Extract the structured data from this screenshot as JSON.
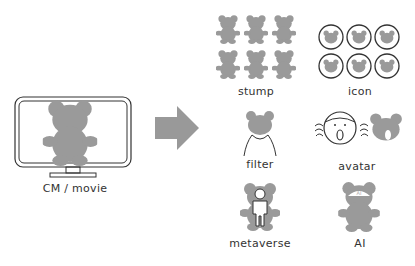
{
  "source": {
    "label": "CM / movie",
    "icon": "monitor-with-bear-icon"
  },
  "arrow": {
    "icon": "right-arrow-icon",
    "color": "#999999"
  },
  "outputs": [
    {
      "id": "stump",
      "label": "stump",
      "icon": "bear-stamps-grid-icon"
    },
    {
      "id": "icon",
      "label": "icon",
      "icon": "bear-circle-icons-grid-icon"
    },
    {
      "id": "filter",
      "label": "filter",
      "icon": "bear-face-filter-icon"
    },
    {
      "id": "avatar",
      "label": "avatar",
      "icon": "face-to-bear-avatar-icon"
    },
    {
      "id": "metaverse",
      "label": "metaverse",
      "icon": "human-in-bear-suit-icon"
    },
    {
      "id": "ai",
      "label": "AI",
      "icon": "ai-bear-icon",
      "badge": "AI"
    }
  ],
  "colors": {
    "bear_fill": "#9a9a9a",
    "outline": "#333333",
    "arrow": "#999999"
  }
}
